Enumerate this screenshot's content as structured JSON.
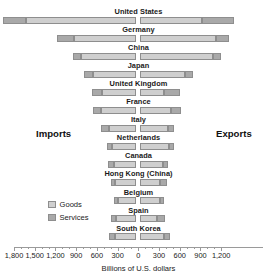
{
  "chart_data": {
    "type": "bar",
    "title": "",
    "subtype": "diverging-stacked-bar",
    "xlabel": "Billions of U.S. dollars",
    "ylabel": "",
    "xlim": [
      -1800,
      1200
    ],
    "grid": false,
    "legend_position": "left-lower",
    "left_caption": "Imports",
    "right_caption": "Exports",
    "tick_labels_left": [
      "1,800",
      "1,500",
      "1,200",
      "900",
      "600",
      "300"
    ],
    "tick_labels_center": "0",
    "tick_labels_right": [
      "300",
      "600",
      "900",
      "1,200"
    ],
    "tick_values": [
      -1800,
      -1500,
      -1200,
      -900,
      -600,
      -300,
      0,
      300,
      600,
      900,
      1200
    ],
    "minor_tick_step": 100,
    "series": [
      {
        "name": "Goods",
        "color": "#cfcfcf"
      },
      {
        "name": "Services",
        "color": "#a9a9a9"
      }
    ],
    "categories": [
      "United States",
      "Germany",
      "China",
      "Japan",
      "United Kingdom",
      "France",
      "Italy",
      "Netherlands",
      "Canada",
      "Hong Kong (China)",
      "Belgium",
      "Spain",
      "South Korea"
    ],
    "rows": [
      {
        "country": "United States",
        "imports_goods": 1600,
        "imports_services": 330,
        "exports_goods": 900,
        "exports_services": 450
      },
      {
        "country": "Germany",
        "imports_goods": 900,
        "imports_services": 245,
        "exports_goods": 1100,
        "exports_services": 190
      },
      {
        "country": "China",
        "imports_goods": 800,
        "imports_services": 120,
        "exports_goods": 1050,
        "exports_services": 120
      },
      {
        "country": "Japan",
        "imports_goods": 620,
        "imports_services": 135,
        "exports_goods": 650,
        "exports_services": 115
      },
      {
        "country": "United Kingdom",
        "imports_goods": 500,
        "imports_services": 145,
        "exports_goods": 350,
        "exports_services": 220
      },
      {
        "country": "France",
        "imports_goods": 510,
        "imports_services": 120,
        "exports_goods": 440,
        "exports_services": 150
      },
      {
        "country": "Italy",
        "imports_goods": 400,
        "imports_services": 105,
        "exports_goods": 400,
        "exports_services": 90
      },
      {
        "country": "Netherlands",
        "imports_goods": 350,
        "imports_services": 80,
        "exports_goods": 410,
        "exports_services": 85
      },
      {
        "country": "Canada",
        "imports_goods": 330,
        "imports_services": 85,
        "exports_goods": 330,
        "exports_services": 65
      },
      {
        "country": "Hong Kong (China)",
        "imports_goods": 310,
        "imports_services": 50,
        "exports_goods": 290,
        "exports_services": 90
      },
      {
        "country": "Belgium",
        "imports_goods": 260,
        "imports_services": 70,
        "exports_goods": 280,
        "exports_services": 70
      },
      {
        "country": "Spain",
        "imports_goods": 290,
        "imports_services": 70,
        "exports_goods": 240,
        "exports_services": 120
      },
      {
        "country": "South Korea",
        "imports_goods": 310,
        "imports_services": 85,
        "exports_goods": 350,
        "exports_services": 80
      }
    ]
  },
  "legend": {
    "items": [
      {
        "label": "Goods"
      },
      {
        "label": "Services"
      }
    ]
  }
}
